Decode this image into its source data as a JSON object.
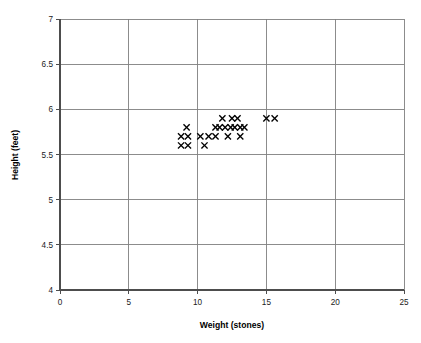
{
  "chart_data": {
    "type": "scatter",
    "title": "",
    "xlabel": "Weight (stones)",
    "ylabel": "Height (feet)",
    "xlim": [
      0,
      25
    ],
    "ylim": [
      4,
      7
    ],
    "xticks": [
      0,
      5,
      10,
      15,
      20,
      25
    ],
    "yticks": [
      4,
      4.5,
      5,
      5.5,
      6,
      6.5,
      7
    ],
    "xtick_labels": [
      "0",
      "5",
      "10",
      "15",
      "20",
      "25"
    ],
    "ytick_labels": [
      "4",
      "4.5",
      "5",
      "5.5",
      "6",
      "6.5",
      "7"
    ],
    "grid": true,
    "legend": false,
    "marker": "x",
    "marker_color": "#000000",
    "series": [
      {
        "name": "Height vs Weight",
        "points": [
          {
            "x": 11.8,
            "y": 5.9
          },
          {
            "x": 12.5,
            "y": 5.9
          },
          {
            "x": 12.9,
            "y": 5.9
          },
          {
            "x": 15.0,
            "y": 5.9
          },
          {
            "x": 15.6,
            "y": 5.9
          },
          {
            "x": 9.2,
            "y": 5.8
          },
          {
            "x": 11.3,
            "y": 5.8
          },
          {
            "x": 11.6,
            "y": 5.8
          },
          {
            "x": 12.0,
            "y": 5.8
          },
          {
            "x": 12.4,
            "y": 5.8
          },
          {
            "x": 12.7,
            "y": 5.8
          },
          {
            "x": 13.1,
            "y": 5.8
          },
          {
            "x": 13.4,
            "y": 5.8
          },
          {
            "x": 8.8,
            "y": 5.7
          },
          {
            "x": 9.3,
            "y": 5.7
          },
          {
            "x": 10.2,
            "y": 5.7
          },
          {
            "x": 10.8,
            "y": 5.7
          },
          {
            "x": 11.3,
            "y": 5.7
          },
          {
            "x": 12.2,
            "y": 5.7
          },
          {
            "x": 13.1,
            "y": 5.7
          },
          {
            "x": 8.8,
            "y": 5.6
          },
          {
            "x": 9.3,
            "y": 5.6
          },
          {
            "x": 10.5,
            "y": 5.6
          }
        ]
      }
    ]
  },
  "axes": {
    "x_title": "Weight (stones)",
    "y_title": "Height (feet)"
  }
}
